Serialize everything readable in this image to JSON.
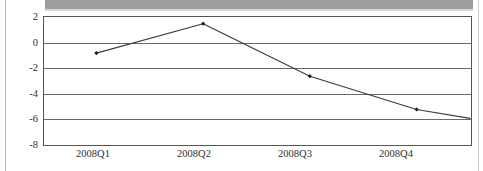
{
  "figure": {
    "banner_label": "",
    "banner_color": "#9d9d9d",
    "background_color": "#ffffff"
  },
  "axis": {
    "y_ticks": [
      "2",
      "0",
      "-2",
      "-4",
      "-6",
      "-8"
    ],
    "x_ticks": [
      "2008Q1",
      "2008Q2",
      "2008Q3",
      "2008Q4"
    ]
  },
  "chart_data": {
    "type": "line",
    "title": "",
    "subtitle": "",
    "xlabel": "",
    "ylabel": "",
    "categories": [
      "2008Q1",
      "2008Q2",
      "2008Q3",
      "2008Q4"
    ],
    "values": [
      -0.9,
      1.4,
      -2.7,
      -5.3
    ],
    "series": [
      {
        "name": "",
        "values": [
          -0.9,
          1.4,
          -2.7,
          -5.3
        ],
        "line_color": "#3a3a3a",
        "marker": "diamond",
        "marker_color": "#1f1f1f"
      }
    ],
    "trailing_segment": {
      "note": "line continues past last marker to right plot edge",
      "end_value": -6.0
    },
    "ylim": [
      -8,
      2
    ],
    "ytick_values": [
      2,
      0,
      -2,
      -4,
      -6,
      -8
    ],
    "grid": true,
    "grid_axis": "y",
    "legend": false,
    "legend_position": "none"
  }
}
